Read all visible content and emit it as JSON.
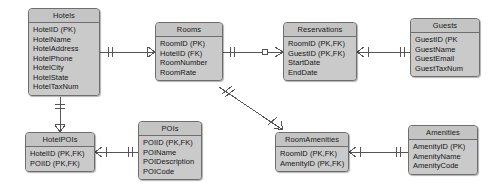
{
  "diagram": {
    "notation": "crow's-foot",
    "colors": {
      "entity_fill": "#c9c9c9",
      "entity_header_fill": "#c4c4c4",
      "entity_border": "#6e6e6e",
      "connector": "#555555",
      "text": "#151515",
      "background": "#ffffff"
    },
    "entities": [
      {
        "id": "hotels",
        "name": "Hotels",
        "x": 28,
        "y": 8,
        "w": 72,
        "attributes": [
          "HotelID (PK)",
          "HotelName",
          "HotelAddress",
          "HotelPhone",
          "HotelCity",
          "HotelState",
          "HotelTaxNum"
        ]
      },
      {
        "id": "rooms",
        "name": "Rooms",
        "x": 155,
        "y": 22,
        "w": 68,
        "attributes": [
          "RoomID (PK)",
          "HotelID (FK)",
          "RoomNumber",
          "RoomRate"
        ]
      },
      {
        "id": "reservations",
        "name": "Reservations",
        "x": 283,
        "y": 22,
        "w": 74,
        "attributes": [
          "RoomID (PK,FK)",
          "GuestID (PK,FK)",
          "StartDate",
          "EndDate"
        ]
      },
      {
        "id": "guests",
        "name": "Guests",
        "x": 410,
        "y": 18,
        "w": 70,
        "attributes": [
          "GuestID (PK",
          "GuestName",
          "GuestEmail",
          "GuestTaxNum"
        ]
      },
      {
        "id": "hotelpois",
        "name": "HotelPOIs",
        "x": 25,
        "y": 132,
        "w": 70,
        "attributes": [
          "HotelID (PK,FK)",
          "POIID (PK,FK)"
        ]
      },
      {
        "id": "pois",
        "name": "POIs",
        "x": 138,
        "y": 121,
        "w": 64,
        "attributes": [
          "POIID (PK,FK)",
          "POIName",
          "POIDescription",
          "POICode"
        ]
      },
      {
        "id": "roomamenities",
        "name": "RoomAmenities",
        "x": 275,
        "y": 132,
        "w": 74,
        "attributes": [
          "RoomID (PK,FK)",
          "AmenityID (PK,FK)"
        ]
      },
      {
        "id": "amenities",
        "name": "Amenities",
        "x": 408,
        "y": 125,
        "w": 70,
        "attributes": [
          "AmenityID (PK)",
          "AmenityName",
          "AmenityCode"
        ]
      }
    ],
    "relationships": [
      {
        "id": "hotels-rooms",
        "from": "Hotels",
        "to": "Rooms",
        "from_cardinality": "one-and-only-one",
        "to_cardinality": "zero-or-many"
      },
      {
        "id": "rooms-reservations",
        "from": "Rooms",
        "to": "Reservations",
        "from_cardinality": "one-and-only-one",
        "to_cardinality": "zero-or-many"
      },
      {
        "id": "reservations-guests",
        "from": "Reservations",
        "to": "Guests",
        "from_cardinality": "one-or-many",
        "to_cardinality": "one-and-only-one"
      },
      {
        "id": "hotels-hotelpois",
        "from": "Hotels",
        "to": "HotelPOIs",
        "from_cardinality": "one-and-only-one",
        "to_cardinality": "zero-or-many"
      },
      {
        "id": "hotelpois-pois",
        "from": "HotelPOIs",
        "to": "POIs",
        "from_cardinality": "one-or-many",
        "to_cardinality": "one-and-only-one"
      },
      {
        "id": "rooms-roomamenities",
        "from": "Rooms",
        "to": "RoomAmenities",
        "from_cardinality": "one-and-only-one",
        "to_cardinality": "zero-or-many"
      },
      {
        "id": "roomamenities-amenities",
        "from": "RoomAmenities",
        "to": "Amenities",
        "from_cardinality": "one-or-many",
        "to_cardinality": "one-and-only-one"
      }
    ]
  }
}
